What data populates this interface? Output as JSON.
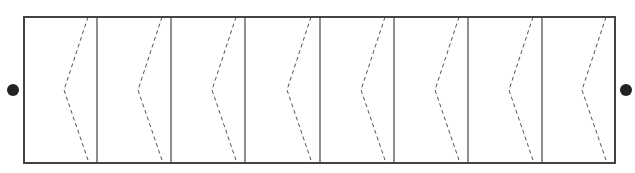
{
  "diagram": {
    "type": "panel-strip",
    "panel_count": 8,
    "box": {
      "x": 24,
      "y": 17,
      "width": 591,
      "height": 146
    },
    "dividers_x": [
      97,
      171,
      245,
      320,
      394,
      468,
      542
    ],
    "chevron_offsets": {
      "top_x": -9,
      "mid_x": -33,
      "bottom_x": -8
    },
    "left_dot": {
      "x": 13,
      "y": 90,
      "r": 6
    },
    "right_dot": {
      "x": 626,
      "y": 90,
      "r": 6
    },
    "colors": {
      "stroke": "#444444",
      "dash": "#555555",
      "dot": "#222222"
    }
  }
}
